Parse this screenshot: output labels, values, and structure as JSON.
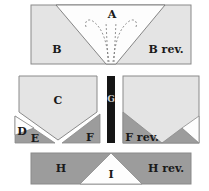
{
  "diagram": {
    "colors": {
      "light": "#e4e4e4",
      "white": "#fdfdfd",
      "dark": "#9c9c9c",
      "bar": "#151515",
      "stroke": "#8a8a8a"
    },
    "labels": {
      "A": "A",
      "B": "B",
      "B_rev": "B rev.",
      "C": "C",
      "D": "D",
      "E": "E",
      "F": "F",
      "F_rev": "F rev.",
      "G": "G",
      "H": "H",
      "H_rev": "H rev.",
      "I": "I"
    }
  }
}
